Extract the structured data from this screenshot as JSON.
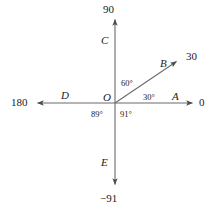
{
  "diagram": {
    "type": "angle-reference-axes",
    "origin": {
      "label": "O",
      "x": 115,
      "y": 103
    },
    "background_color": "#ffffff",
    "line_color": "#6b6b6b",
    "text_color": "#1a1a1a",
    "rays": [
      {
        "name": "ray-a",
        "label": "A",
        "value": "0",
        "direction_deg": 0,
        "endpoint": {
          "x": 194,
          "y": 103
        }
      },
      {
        "name": "ray-b",
        "label": "B",
        "value": "30",
        "direction_deg": 30,
        "endpoint": {
          "x": 178,
          "y": 60
        }
      },
      {
        "name": "ray-c",
        "label": "C",
        "value": "90",
        "direction_deg": 90,
        "endpoint": {
          "x": 115,
          "y": 18
        }
      },
      {
        "name": "ray-d",
        "label": "D",
        "value": "180",
        "direction_deg": 180,
        "endpoint": {
          "x": 36,
          "y": 103
        }
      },
      {
        "name": "ray-e",
        "label": "E",
        "value": "-91",
        "direction_deg": 270,
        "endpoint": {
          "x": 115,
          "y": 186
        }
      }
    ],
    "angle_labels": [
      {
        "name": "angle-30",
        "text": "30°"
      },
      {
        "name": "angle-60",
        "text": "60°"
      },
      {
        "name": "angle-89",
        "text": "89°"
      },
      {
        "name": "angle-91",
        "text": "91°"
      }
    ],
    "value_labels": {
      "top": "90",
      "upper_right": "30",
      "right": "0",
      "left": "180",
      "bottom": "−91"
    }
  }
}
